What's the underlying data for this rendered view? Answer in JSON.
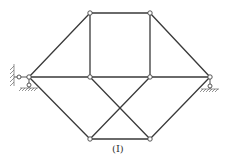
{
  "figure": {
    "caption": "(I)",
    "type": "planar truss",
    "nodes": [
      {
        "id": "L",
        "x": 29,
        "y": 77,
        "role": "left support joint"
      },
      {
        "id": "T1",
        "x": 90,
        "y": 13,
        "role": "top left"
      },
      {
        "id": "T2",
        "x": 150,
        "y": 13,
        "role": "top right"
      },
      {
        "id": "M1",
        "x": 90,
        "y": 77,
        "role": "middle left"
      },
      {
        "id": "M2",
        "x": 150,
        "y": 77,
        "role": "middle right"
      },
      {
        "id": "R",
        "x": 210,
        "y": 77,
        "role": "right support joint"
      },
      {
        "id": "B1",
        "x": 90,
        "y": 139,
        "role": "bottom left"
      },
      {
        "id": "B2",
        "x": 150,
        "y": 139,
        "role": "bottom right"
      }
    ],
    "members": [
      [
        "L",
        "T1"
      ],
      [
        "T1",
        "T2"
      ],
      [
        "T2",
        "R"
      ],
      [
        "T1",
        "M1"
      ],
      [
        "T2",
        "M2"
      ],
      [
        "L",
        "M1"
      ],
      [
        "M1",
        "M2"
      ],
      [
        "M2",
        "R"
      ],
      [
        "L",
        "B1"
      ],
      [
        "B1",
        "B2"
      ],
      [
        "B2",
        "R"
      ],
      [
        "M1",
        "B2"
      ],
      [
        "M2",
        "B1"
      ]
    ],
    "supports": [
      {
        "node": "L",
        "type": "fixed pin (horizontal + vertical links)",
        "wall_side": "left"
      },
      {
        "node": "R",
        "type": "roller (vertical link)"
      }
    ]
  }
}
